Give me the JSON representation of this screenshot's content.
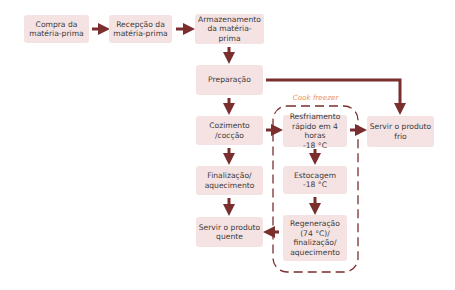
{
  "diagram": {
    "colors": {
      "box_fill": "#f5e3e3",
      "arrow": "#7a2e2e",
      "text": "#3a3a3a",
      "cook_freezer_label": "#e8925a",
      "dashed_border": "#7a2e2e"
    },
    "nodes": {
      "compra": "Compra da\nmatéria-prima",
      "recepcao": "Recepção da\nmatéria-prima",
      "armazenamento": "Armazenamento\nda matéria-prima",
      "preparacao": "Preparação",
      "cozimento": "Cozimento\n/cocção",
      "finalizacao": "Finalização/\naquecimento",
      "servir_quente": "Servir o produto\nquente",
      "resfriamento": "Resfriamento\nrápido em 4 horas\n-18 °C",
      "estocagem": "Estocagem\n-18 °C",
      "regeneracao": "Regeneração\n(74 °C)/\nfinalização/\naquecimento",
      "servir_frio": "Servir o produto\nfrio"
    },
    "group_label": "Cook freezer",
    "edges": [
      [
        "compra",
        "recepcao"
      ],
      [
        "recepcao",
        "armazenamento"
      ],
      [
        "armazenamento",
        "preparacao"
      ],
      [
        "preparacao",
        "cozimento"
      ],
      [
        "preparacao",
        "servir_frio"
      ],
      [
        "cozimento",
        "finalizacao"
      ],
      [
        "finalizacao",
        "servir_quente"
      ],
      [
        "cozimento",
        "resfriamento"
      ],
      [
        "resfriamento",
        "servir_frio"
      ],
      [
        "resfriamento",
        "estocagem"
      ],
      [
        "estocagem",
        "regeneracao"
      ],
      [
        "regeneracao",
        "servir_quente"
      ]
    ]
  }
}
